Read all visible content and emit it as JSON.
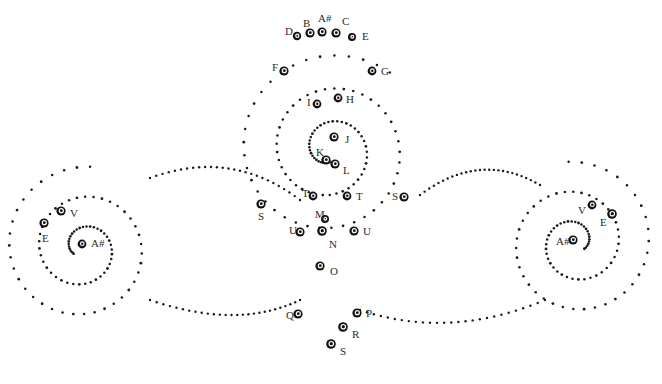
{
  "figure": {
    "width": 662,
    "height": 384,
    "background_color": "#ffffff",
    "dot_color": "#1a1a1a",
    "node_color": "#111111",
    "label_color": "#2a2a2a"
  },
  "chart_data": {
    "type": "scatter",
    "title": "",
    "xlabel": "",
    "ylabel": "",
    "grid": false,
    "legend": false,
    "xlim": [
      0,
      662
    ],
    "ylim": [
      0,
      384
    ],
    "nodes": [
      {
        "label": "D",
        "x": 297,
        "y": 36,
        "lx": 285,
        "ly": 31,
        "r": 4.2
      },
      {
        "label": "B",
        "x": 310,
        "y": 33,
        "lx": 303,
        "ly": 23,
        "r": 4.6
      },
      {
        "label": "A#",
        "x": 322,
        "y": 32,
        "lx": 318,
        "ly": 18,
        "r": 4.6
      },
      {
        "label": "C",
        "x": 336,
        "y": 33,
        "lx": 342,
        "ly": 21,
        "r": 4.6
      },
      {
        "label": "E",
        "x": 352,
        "y": 37,
        "lx": 362,
        "ly": 36,
        "r": 4.0
      },
      {
        "label": "F",
        "x": 284,
        "y": 71,
        "lx": 272,
        "ly": 67,
        "r": 4.6
      },
      {
        "label": "G",
        "x": 372,
        "y": 71,
        "lx": 381,
        "ly": 71,
        "r": 4.4
      },
      {
        "label": "H",
        "x": 338,
        "y": 98,
        "lx": 346,
        "ly": 99,
        "r": 4.4
      },
      {
        "label": "I",
        "x": 317,
        "y": 104,
        "lx": 307,
        "ly": 102,
        "r": 4.4
      },
      {
        "label": "J",
        "x": 334,
        "y": 137,
        "lx": 345,
        "ly": 139,
        "r": 4.6
      },
      {
        "label": "K",
        "x": 326,
        "y": 160,
        "lx": 316,
        "ly": 152,
        "r": 4.6
      },
      {
        "label": "L",
        "x": 335,
        "y": 164,
        "lx": 343,
        "ly": 170,
        "r": 4.6
      },
      {
        "label": "T",
        "x": 313,
        "y": 196,
        "lx": 302,
        "ly": 193,
        "r": 4.4
      },
      {
        "label": "T",
        "x": 347,
        "y": 196,
        "lx": 356,
        "ly": 196,
        "r": 4.4
      },
      {
        "label": "S",
        "x": 261,
        "y": 204,
        "lx": 258,
        "ly": 216,
        "r": 4.6
      },
      {
        "label": "S",
        "x": 404,
        "y": 197,
        "lx": 392,
        "ly": 196,
        "r": 4.6
      },
      {
        "label": "M",
        "x": 325,
        "y": 219,
        "lx": 315,
        "ly": 214,
        "r": 4.0
      },
      {
        "label": "U",
        "x": 300,
        "y": 232,
        "lx": 289,
        "ly": 230,
        "r": 4.6
      },
      {
        "label": "N",
        "x": 322,
        "y": 231,
        "lx": 329,
        "ly": 244,
        "r": 4.8
      },
      {
        "label": "U",
        "x": 354,
        "y": 231,
        "lx": 363,
        "ly": 231,
        "r": 4.6
      },
      {
        "label": "O",
        "x": 320,
        "y": 266,
        "lx": 330,
        "ly": 271,
        "r": 4.6
      },
      {
        "label": "Q",
        "x": 298,
        "y": 314,
        "lx": 286,
        "ly": 315,
        "r": 4.6
      },
      {
        "label": "P",
        "x": 357,
        "y": 313,
        "lx": 366,
        "ly": 313,
        "r": 4.6
      },
      {
        "label": "R",
        "x": 343,
        "y": 327,
        "lx": 352,
        "ly": 334,
        "r": 4.8
      },
      {
        "label": "S",
        "x": 331,
        "y": 344,
        "lx": 340,
        "ly": 351,
        "r": 4.8
      },
      {
        "label": "V",
        "x": 61,
        "y": 211,
        "lx": 70,
        "ly": 213,
        "r": 4.6
      },
      {
        "label": "E",
        "x": 44,
        "y": 223,
        "lx": 42,
        "ly": 238,
        "r": 4.6
      },
      {
        "label": "A#",
        "x": 82,
        "y": 244,
        "lx": 91,
        "ly": 243,
        "r": 4.4
      },
      {
        "label": "V",
        "x": 592,
        "y": 205,
        "lx": 578,
        "ly": 210,
        "r": 4.4
      },
      {
        "label": "E",
        "x": 612,
        "y": 214,
        "lx": 600,
        "ly": 222,
        "r": 4.8
      },
      {
        "label": "A#",
        "x": 573,
        "y": 240,
        "lx": 556,
        "ly": 241,
        "r": 4.6
      }
    ],
    "spirals": [
      {
        "name": "left-spiral",
        "cx": 83,
        "cy": 248,
        "turns": 2.35,
        "r_start": 11,
        "r_growth": 30,
        "theta0": 2.6,
        "dot_count": 92,
        "direction": 1
      },
      {
        "name": "right-spiral",
        "cx": 575,
        "cy": 243,
        "turns": 2.35,
        "r_start": 11,
        "r_growth": 30,
        "theta0": 0.55,
        "dot_count": 92,
        "direction": -1
      },
      {
        "name": "center-spiral",
        "cx": 330,
        "cy": 150,
        "turns": 2.6,
        "r_start": 12,
        "r_growth": 33,
        "theta0": 1.6,
        "dot_count": 108,
        "direction": 1
      }
    ],
    "connector_arcs": [
      {
        "name": "left-to-center-upper",
        "x1": 150,
        "y1": 178,
        "cx": 232,
        "cy": 148,
        "x2": 300,
        "y2": 200
      },
      {
        "name": "left-to-center-lower",
        "x1": 150,
        "y1": 300,
        "cx": 238,
        "cy": 330,
        "x2": 300,
        "y2": 300
      },
      {
        "name": "center-to-right-upper",
        "x1": 420,
        "y1": 195,
        "cx": 480,
        "cy": 150,
        "x2": 540,
        "y2": 185
      },
      {
        "name": "center-to-right-lower",
        "x1": 360,
        "y1": 310,
        "cx": 450,
        "cy": 340,
        "x2": 545,
        "y2": 300
      }
    ]
  }
}
